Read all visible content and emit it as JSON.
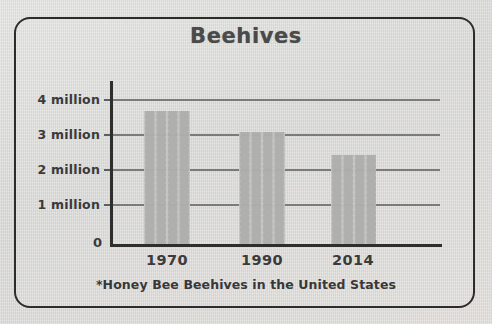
{
  "frame": {
    "border_color": "#2c2c2c",
    "background_color": "#d9d9d6"
  },
  "chart_data": {
    "type": "bar",
    "title": "Beehives",
    "categories": [
      "1970",
      "1990",
      "2014"
    ],
    "values": [
      3.8,
      3.2,
      2.55
    ],
    "xlabel": "",
    "ylabel": "",
    "ylim": [
      0,
      4.7
    ],
    "yticks": [
      0,
      1,
      2,
      3,
      4
    ],
    "ytick_labels": [
      "0",
      "1 million",
      "2 million",
      "3 million",
      "4 million"
    ],
    "grid": true,
    "legend": false,
    "annotations": [
      "*Honey Bee Beehives in the United States"
    ],
    "series": [
      {
        "name": "Honey Bee Beehives",
        "values": [
          3.8,
          3.2,
          2.55
        ],
        "units": "million",
        "fill": "honeycomb-pattern",
        "fill_color": "#b0b0ae"
      }
    ]
  },
  "axis": {
    "y_labels": [
      {
        "text": "4 million",
        "value": 4
      },
      {
        "text": "3 million",
        "value": 3
      },
      {
        "text": "2 million",
        "value": 2
      },
      {
        "text": "1 million",
        "value": 1
      }
    ],
    "zero_label": "0",
    "x_labels": [
      "1970",
      "1990",
      "2014"
    ]
  },
  "footnote": "*Honey Bee Beehives in the United States"
}
